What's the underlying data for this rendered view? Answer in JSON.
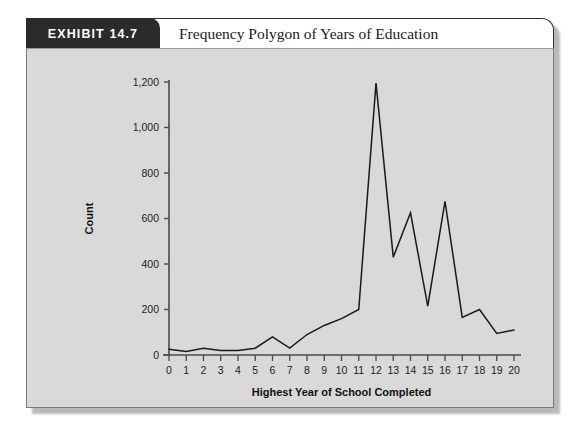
{
  "exhibit": {
    "badge": "EXHIBIT 14.7",
    "title": "Frequency Polygon of Years of Education"
  },
  "chart_data": {
    "type": "line",
    "title": "Frequency Polygon of Years of Education",
    "xlabel": "Highest Year of School Completed",
    "ylabel": "Count",
    "x": [
      0,
      1,
      2,
      3,
      4,
      5,
      6,
      7,
      8,
      9,
      10,
      11,
      12,
      13,
      14,
      15,
      16,
      17,
      18,
      19,
      20
    ],
    "values": [
      25,
      15,
      30,
      20,
      20,
      30,
      80,
      30,
      90,
      130,
      160,
      200,
      1195,
      430,
      625,
      215,
      675,
      165,
      200,
      95,
      110
    ],
    "xlim": [
      0,
      20
    ],
    "ylim": [
      0,
      1200
    ],
    "xticks": [
      "0",
      "1",
      "2",
      "3",
      "4",
      "5",
      "6",
      "7",
      "8",
      "9",
      "10",
      "11",
      "12",
      "13",
      "14",
      "15",
      "16",
      "17",
      "18",
      "19",
      "20"
    ],
    "yticks": [
      "0",
      "200",
      "400",
      "600",
      "800",
      "1,000",
      "1,200"
    ],
    "ytick_values": [
      0,
      200,
      400,
      600,
      800,
      1000,
      1200
    ],
    "grid": false,
    "legend": null,
    "line_color": "#1a1a1a",
    "plot_background": "#d9d9d9"
  }
}
